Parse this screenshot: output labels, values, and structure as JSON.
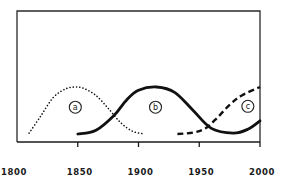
{
  "chart_data": {
    "type": "line",
    "title": "",
    "xlabel": "",
    "ylabel": "",
    "xlim": [
      1800,
      2000
    ],
    "ylim": [
      0,
      1
    ],
    "grid": false,
    "legend": "inline circled labels",
    "x_ticks": [
      1800,
      1850,
      1900,
      1950,
      2000
    ],
    "x_tick_labels": [
      "1800",
      "1850",
      "1900",
      "1950",
      "2000"
    ],
    "series": [
      {
        "name": "a",
        "label": "a",
        "style": "dotted",
        "x": [
          1810,
          1820,
          1830,
          1840,
          1848,
          1855,
          1865,
          1875,
          1885,
          1895,
          1905
        ],
        "values": [
          0.02,
          0.4,
          0.78,
          0.96,
          1.0,
          0.97,
          0.82,
          0.55,
          0.25,
          0.06,
          0.0
        ]
      },
      {
        "name": "b",
        "label": "b",
        "style": "solid",
        "x": [
          1850,
          1865,
          1880,
          1890,
          1900,
          1915,
          1930,
          1945,
          1960,
          1978,
          1990,
          2000
        ],
        "values": [
          0.0,
          0.08,
          0.4,
          0.72,
          0.93,
          1.0,
          0.88,
          0.5,
          0.12,
          0.02,
          0.1,
          0.28
        ]
      },
      {
        "name": "c",
        "label": "c",
        "style": "dashed",
        "x": [
          1932,
          1945,
          1955,
          1965,
          1975,
          1985,
          2000
        ],
        "values": [
          0.0,
          0.03,
          0.12,
          0.35,
          0.62,
          0.82,
          1.0
        ]
      }
    ],
    "annotations": [
      {
        "text": "a",
        "x": 1848,
        "y": 0.58,
        "circled": true
      },
      {
        "text": "b",
        "x": 1914,
        "y": 0.58,
        "circled": true
      },
      {
        "text": "c",
        "x": 1990,
        "y": 0.6,
        "circled": true
      }
    ]
  }
}
